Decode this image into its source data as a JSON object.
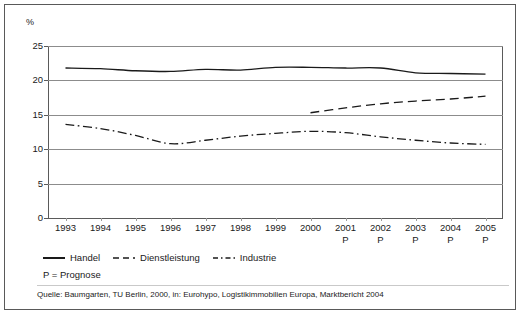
{
  "chart_data": {
    "type": "line",
    "title": "",
    "subtitle": "",
    "xlabel": "",
    "ylabel": "%",
    "unit_label": "%",
    "ylim": [
      0,
      25
    ],
    "ytick_values": [
      0,
      5,
      10,
      15,
      20,
      25
    ],
    "ytick_labels": [
      "0",
      "5",
      "10",
      "15",
      "20",
      "25"
    ],
    "grid": "horizontal",
    "legend_position": "below-axes-left",
    "x": [
      1993,
      1994,
      1995,
      1996,
      1997,
      1998,
      1999,
      2000,
      2001,
      2002,
      2003,
      2004,
      2005
    ],
    "categories": [
      "1993",
      "1994",
      "1995",
      "1996",
      "1997",
      "1998",
      "1999",
      "2000",
      "2001",
      "2002",
      "2003",
      "2004",
      "2005"
    ],
    "category_sublabels": [
      "",
      "",
      "",
      "",
      "",
      "",
      "",
      "",
      "P",
      "P",
      "P",
      "P",
      "P"
    ],
    "forecast_from": "2001",
    "series": [
      {
        "name": "Handel",
        "style": "solid",
        "color": "#1a1a1a",
        "values": [
          21.8,
          21.7,
          21.4,
          21.3,
          21.6,
          21.5,
          21.9,
          21.9,
          21.8,
          21.8,
          21.1,
          21.0,
          20.9
        ]
      },
      {
        "name": "Dienstleistung",
        "style": "dashed",
        "color": "#1a1a1a",
        "values": [
          null,
          null,
          null,
          null,
          null,
          null,
          null,
          15.3,
          16.0,
          16.6,
          17.0,
          17.3,
          17.7
        ]
      },
      {
        "name": "Industrie",
        "style": "dash-dot",
        "color": "#1a1a1a",
        "values": [
          13.6,
          13.0,
          12.0,
          10.8,
          11.3,
          11.9,
          12.3,
          12.6,
          12.4,
          11.8,
          11.3,
          10.9,
          10.7
        ]
      }
    ],
    "annotations": {
      "prognose_note": "P = Prognose",
      "source": "Quelle: Baumgarten, TU Berlin, 2000, in: Eurohypo, Logistikimmobilien Europa, Marktbericht 2004"
    }
  },
  "axes": {
    "unit_label": "%",
    "y_ticks": [
      "25",
      "20",
      "15",
      "10",
      "5",
      "0"
    ],
    "x_ticks": [
      {
        "year": "1993",
        "sub": ""
      },
      {
        "year": "1994",
        "sub": ""
      },
      {
        "year": "1995",
        "sub": ""
      },
      {
        "year": "1996",
        "sub": ""
      },
      {
        "year": "1997",
        "sub": ""
      },
      {
        "year": "1998",
        "sub": ""
      },
      {
        "year": "1999",
        "sub": ""
      },
      {
        "year": "2000",
        "sub": ""
      },
      {
        "year": "2001",
        "sub": "P"
      },
      {
        "year": "2002",
        "sub": "P"
      },
      {
        "year": "2003",
        "sub": "P"
      },
      {
        "year": "2004",
        "sub": "P"
      },
      {
        "year": "2005",
        "sub": "P"
      }
    ]
  },
  "legend": {
    "items": [
      {
        "label": "Handel",
        "style": "solid"
      },
      {
        "label": "Dienstleistung",
        "style": "dashed"
      },
      {
        "label": "Industrie",
        "style": "dash-dot"
      }
    ]
  },
  "notes": {
    "prognose": "P = Prognose",
    "source": "Quelle: Baumgarten, TU Berlin, 2000, in: Eurohypo, Logistikimmobilien Europa, Marktbericht 2004"
  }
}
